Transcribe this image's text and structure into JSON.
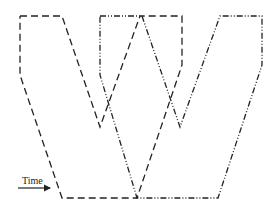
{
  "diagram": {
    "label_time": "Time",
    "stroke_color": "#222222",
    "shapes": [
      {
        "name": "w-shape-dashed",
        "style": "dashed",
        "dasharray": "7 4",
        "points": "20,16 62,16 100,127 140,16 182,16 182,65 137,198 62,198 20,75 20,16"
      },
      {
        "name": "w-shape-dash-dot",
        "style": "dash-dot-dot",
        "dasharray": "6 2 1 2 1 2",
        "points": "100,16 142,16 180,127 220,16 262,16 262,65 218,198 137,198 100,75 100,16"
      }
    ],
    "arrow": {
      "x1": 18,
      "y1": 188,
      "x2": 50,
      "y2": 188
    }
  }
}
